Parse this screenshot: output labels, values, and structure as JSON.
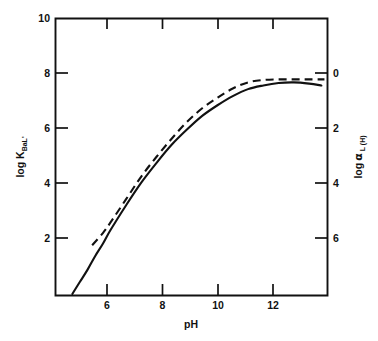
{
  "chart_data": {
    "type": "line",
    "title": "",
    "xlabel": "pH",
    "ylabel": "log K",
    "ylabel_sub": "BaL'",
    "ylabel_full": "log K BaL'",
    "y2label_prefix": "log",
    "y2label_greek": "α",
    "y2label_sub": "L (H)",
    "y2label_full": "log α L (H)",
    "xlim": [
      4.2,
      13.1
    ],
    "ylim": [
      0.9,
      10.0
    ],
    "y2lim": [
      7.1,
      -2.0
    ],
    "grid": false,
    "legend": false,
    "xticks": [
      6,
      8,
      10,
      12
    ],
    "xtick_labels": [
      "6",
      "8",
      "10",
      "12"
    ],
    "yticks": [
      2,
      4,
      6,
      8,
      10
    ],
    "ytick_labels": [
      "2",
      "4",
      "6",
      "8",
      "10"
    ],
    "y2ticks": [
      0,
      2,
      4,
      6
    ],
    "y2tick_labels": [
      "0",
      "2",
      "4",
      "6"
    ],
    "y2_relation": "right = 8 - left",
    "series": [
      {
        "name": "log K BaL' (solid)",
        "style": "solid",
        "x": [
          4.75,
          5.0,
          5.25,
          5.5,
          5.75,
          6.0,
          6.5,
          7.0,
          7.5,
          8.0,
          8.5,
          9.0,
          9.5,
          10.0,
          10.5,
          11.0,
          11.5,
          12.0,
          12.5,
          12.9
        ],
        "y": [
          0.95,
          1.35,
          1.75,
          2.2,
          2.6,
          3.05,
          3.85,
          4.6,
          5.25,
          5.85,
          6.35,
          6.8,
          7.15,
          7.45,
          7.68,
          7.8,
          7.88,
          7.9,
          7.86,
          7.8
        ]
      },
      {
        "name": "log K BaL' (dashed)",
        "style": "dashed",
        "x": [
          5.4,
          5.75,
          6.0,
          6.5,
          7.0,
          7.5,
          8.0,
          8.5,
          9.0,
          9.5,
          10.0,
          10.5,
          11.0,
          11.5,
          12.0,
          12.5,
          13.0
        ],
        "y": [
          2.55,
          2.95,
          3.3,
          4.05,
          4.8,
          5.45,
          6.05,
          6.6,
          7.05,
          7.4,
          7.7,
          7.9,
          7.98,
          8.0,
          8.0,
          8.0,
          8.0
        ]
      }
    ],
    "annotations": []
  },
  "axis": {
    "x_title": "pH",
    "left_title_main": "log K",
    "left_title_sub": "BaL'",
    "right_title_main": "log",
    "right_title_greek": "α",
    "right_title_sub": "L (H)"
  }
}
